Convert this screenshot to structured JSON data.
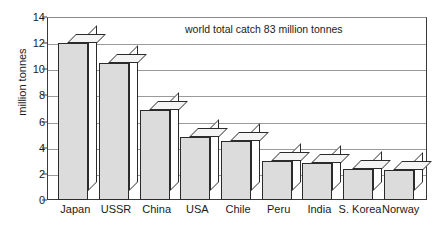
{
  "chart_data": {
    "type": "bar",
    "title": "",
    "subtitle": "",
    "xlabel": "",
    "ylabel": "million tonnes",
    "ylim": [
      0,
      14
    ],
    "ytick_step": 2,
    "yticks": [
      "0",
      "2",
      "4",
      "6",
      "8",
      "10",
      "12",
      "14"
    ],
    "grid": true,
    "legend": "none",
    "annotation": "world total catch 83 million tonnes",
    "units": "million tonnes",
    "categories": [
      "Japan",
      "USSR",
      "China",
      "USA",
      "Chile",
      "Peru",
      "India",
      "S. Korea",
      "Norway"
    ],
    "values": [
      12.0,
      10.5,
      6.9,
      4.8,
      4.5,
      3.0,
      2.8,
      2.4,
      2.3
    ],
    "style": {
      "bar_face_color": "#dcdcdc",
      "bar_top_color": "#f4f4f4",
      "bar_side_color": "#ffffff",
      "bar_outline_color": "#2b2b2b",
      "grid_color": "#9a9a9a",
      "axis_color": "#3a3a3a",
      "text_color": "#1a1a1a",
      "background": "#ffffff"
    }
  }
}
